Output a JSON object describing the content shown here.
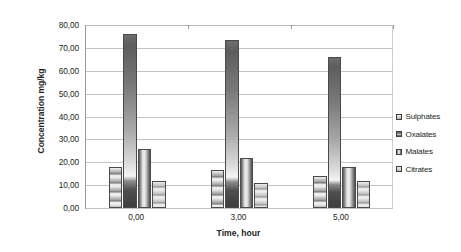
{
  "chart_data": {
    "type": "bar",
    "title": "",
    "xlabel": "Time, hour",
    "ylabel": "Concentration mg/kg",
    "categories": [
      "0,00",
      "3,00",
      "5,00"
    ],
    "series": [
      {
        "name": "Sulphates",
        "values": [
          18.0,
          16.5,
          14.0
        ],
        "swatch": "#a9a9a9"
      },
      {
        "name": "Oxalates",
        "values": [
          76.0,
          73.5,
          65.8
        ],
        "swatch": "#8f8f8f"
      },
      {
        "name": "Malates",
        "values": [
          26.0,
          22.0,
          18.0
        ],
        "swatch": "#6e6e6e"
      },
      {
        "name": "Citrates",
        "values": [
          11.8,
          11.0,
          12.0
        ],
        "swatch": "#c2c2c2"
      }
    ],
    "ylim": [
      0,
      80
    ],
    "ytick_step": 10,
    "ytick_labels": [
      "80,00",
      "70,00",
      "60,00",
      "50,00",
      "40,00",
      "30,00",
      "20,00",
      "10,00",
      "0,00"
    ],
    "grid": true,
    "legend_position": "right",
    "orientation": "vertical"
  },
  "legend": {
    "items": [
      {
        "label": "Sulphates"
      },
      {
        "label": "Oxalates"
      },
      {
        "label": "Malates"
      },
      {
        "label": "Citrates"
      }
    ]
  }
}
